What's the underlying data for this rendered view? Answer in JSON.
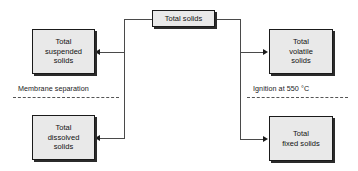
{
  "diagram": {
    "type": "flowchart",
    "nodes": [
      {
        "id": "total-solids",
        "label": "Total solids",
        "lines": [
          "Total solids"
        ]
      },
      {
        "id": "total-suspended",
        "label": "Total suspended solids",
        "lines": [
          "Total",
          "suspended",
          "solids"
        ]
      },
      {
        "id": "total-dissolved",
        "label": "Total dissolved solids",
        "lines": [
          "Total",
          "dissolved",
          "solids"
        ]
      },
      {
        "id": "total-volatile",
        "label": "Total volatile solids",
        "lines": [
          "Total",
          "volatile",
          "solids"
        ]
      },
      {
        "id": "total-fixed",
        "label": "Total fixed solids",
        "lines": [
          "Total",
          "fixed solids"
        ]
      }
    ],
    "edges": [
      {
        "from": "total-solids",
        "to": "total-suspended",
        "direction": "left"
      },
      {
        "from": "total-solids",
        "to": "total-dissolved",
        "direction": "left"
      },
      {
        "from": "total-solids",
        "to": "total-volatile",
        "direction": "right"
      },
      {
        "from": "total-solids",
        "to": "total-fixed",
        "direction": "right"
      }
    ],
    "separators": [
      {
        "id": "membrane",
        "label": "Membrane separation",
        "side": "left"
      },
      {
        "id": "ignition",
        "label": "Ignition at 550 °C",
        "side": "right"
      }
    ],
    "colors": {
      "node_fill": "#e9e9e9",
      "node_border": "#1a1a1a",
      "node_shadow": "#2b2b2b",
      "connector": "#4a4a4a",
      "background": "#ffffff",
      "text": "#111111"
    }
  }
}
